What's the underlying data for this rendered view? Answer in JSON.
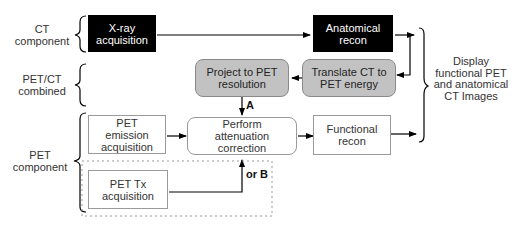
{
  "groups": {
    "ct": "CT component",
    "petct": "PET/CT combined",
    "pet": "PET component"
  },
  "nodes": {
    "xray": "X-ray acquisition",
    "anat_recon": "Anatomical recon",
    "project": "Project to PET resolution",
    "translate": "Translate CT to PET energy",
    "emission": "PET emission acquisition",
    "attenuation": "Perform attenuation correction",
    "functional": "Functional recon",
    "tx": "PET Tx acquisition"
  },
  "edge_labels": {
    "a": "A",
    "or_b": "or B"
  },
  "output_label": "Display functional PET and anatomical CT Images",
  "colors": {
    "black_box": "#000000",
    "gray_box": "#c2c2c2",
    "white_box": "#ffffff",
    "line": "#000000"
  }
}
